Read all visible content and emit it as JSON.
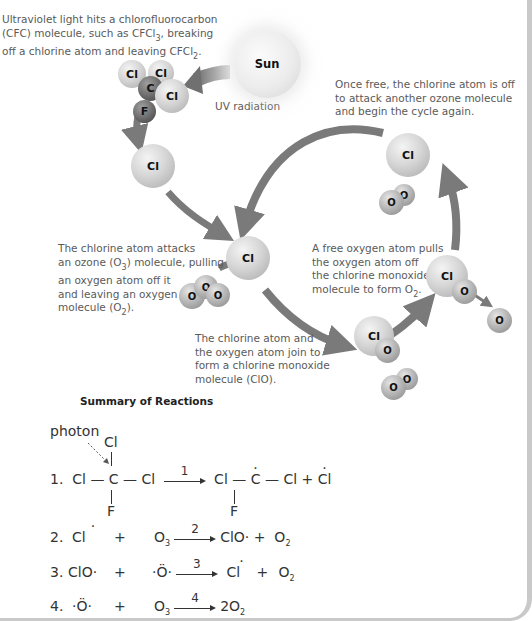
{
  "diagram": {
    "captions": {
      "uv_hits": "Ultraviolet light hits a chlorofluorocarbon (CFC) molecule, such as CFCl",
      "uv_hits_l1": "Ultraviolet light hits a chlorofluorocarbon",
      "uv_hits_l2a": "(CFC) molecule, such as CFCl",
      "uv_hits_l2sub": "3",
      "uv_hits_l2b": ", breaking",
      "uv_hits_l3a": "off a chlorine atom and leaving CFCl",
      "uv_hits_l3sub": "2",
      "uv_hits_l3b": ".",
      "once_free_l1": "Once free, the chlorine atom is off",
      "once_free_l2": "to attack another ozone molecule",
      "once_free_l3": "and begin the cycle again.",
      "attacks_l1": "The chlorine atom attacks",
      "attacks_l2a": "an ozone (O",
      "attacks_l2sub": "3",
      "attacks_l2b": ") molecule, pulling",
      "attacks_l3": "an oxygen atom off it",
      "attacks_l4": "and leaving an oxygen",
      "attacks_l5a": "molecule (O",
      "attacks_l5sub": "2",
      "attacks_l5b": ").",
      "free_oxygen_l1": "A free oxygen atom pulls",
      "free_oxygen_l2": "the oxygen atom off",
      "free_oxygen_l3": "the chlorine monoxide",
      "free_oxygen_l4a": "molecule to form O",
      "free_oxygen_l4sub": "2",
      "free_oxygen_l4b": ".",
      "join_l1": "The chlorine atom and",
      "join_l2": "the oxygen atom join to",
      "join_l3": "form a chlorine monoxide",
      "join_l4": "molecule (ClO).",
      "uv_radiation": "UV radiation"
    },
    "labels": {
      "sun": "Sun",
      "cl": "Cl",
      "c": "C",
      "f": "F",
      "o": "O"
    }
  },
  "summary": {
    "title": "Summary of Reactions",
    "photon": "photon",
    "r1": {
      "num": "1.",
      "lhs_left": "Cl",
      "lhs_center": "C",
      "lhs_right": "Cl",
      "top": "Cl",
      "bottom": "F",
      "arrow": "1",
      "rhs_left": "Cl",
      "rhs_center": "C",
      "rhs_right": "Cl",
      "rhs_bottom": "F",
      "plus": "+",
      "product": "Cl"
    },
    "r2": {
      "num": "2.",
      "a": "Cl",
      "plus1": "+",
      "b": "O",
      "b_sub": "3",
      "arrow": "2",
      "c": "ClO·",
      "plus2": "+",
      "d": "O",
      "d_sub": "2"
    },
    "r3": {
      "num": "3.",
      "a": "ClO·",
      "plus1": "+",
      "b": "·Ö·",
      "arrow": "3",
      "c": "Cl",
      "plus2": "+",
      "d": "O",
      "d_sub": "2"
    },
    "r4": {
      "num": "4.",
      "a": "·Ö·",
      "plus1": "+",
      "b": "O",
      "b_sub": "3",
      "arrow": "4",
      "c": "2O",
      "c_sub": "2"
    }
  },
  "colors": {
    "arrow": "#7a7a7a",
    "text": "#5a5a5a",
    "frame": "#c9c9c9"
  }
}
